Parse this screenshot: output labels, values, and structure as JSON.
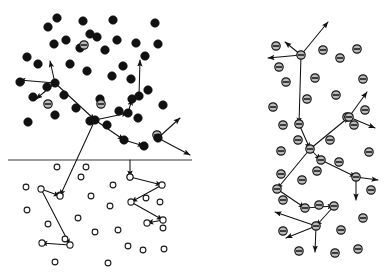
{
  "figure": {
    "background_color": "#ffffff",
    "ink_color": "#111111",
    "width": 391,
    "height": 280,
    "panel_count": 2
  },
  "legend_semantics": {
    "solid_circle": "filled particle (dense phase)",
    "open_circle": "open particle (dilute phase)",
    "hatched_circle": "hatched particle with horizontal bar (negatively marked species)"
  },
  "left_panel": {
    "name": "left-panel",
    "interface_line": {
      "x1": 8,
      "y1": 160,
      "x2": 192,
      "y2": 160,
      "color": "#3a3a3a"
    },
    "solid_particles": [
      [
        57,
        18
      ],
      [
        83,
        21
      ],
      [
        48,
        27
      ],
      [
        113,
        20
      ],
      [
        155,
        23
      ],
      [
        90,
        34
      ],
      [
        66,
        40
      ],
      [
        97,
        37
      ],
      [
        117,
        40
      ],
      [
        136,
        43
      ],
      [
        54,
        44
      ],
      [
        80,
        48
      ],
      [
        105,
        50
      ],
      [
        27,
        57
      ],
      [
        145,
        56
      ],
      [
        158,
        44
      ],
      [
        38,
        64
      ],
      [
        70,
        64
      ],
      [
        123,
        66
      ],
      [
        87,
        71
      ],
      [
        112,
        76
      ],
      [
        131,
        79
      ],
      [
        20,
        82
      ],
      [
        47,
        87
      ],
      [
        64,
        95
      ],
      [
        33,
        97
      ],
      [
        100,
        99
      ],
      [
        148,
        90
      ],
      [
        76,
        108
      ],
      [
        119,
        111
      ],
      [
        55,
        115
      ],
      [
        90,
        121
      ],
      [
        138,
        118
      ],
      [
        107,
        125
      ],
      [
        28,
        122
      ],
      [
        163,
        105
      ]
    ],
    "hatched_particles": [
      [
        84,
        45
      ],
      [
        48,
        104
      ],
      [
        101,
        104
      ],
      [
        157,
        135
      ]
    ],
    "open_particles": [
      [
        57,
        167
      ],
      [
        86,
        167
      ],
      [
        26,
        187
      ],
      [
        60,
        195
      ],
      [
        91,
        196
      ],
      [
        113,
        185
      ],
      [
        110,
        206
      ],
      [
        27,
        210
      ],
      [
        48,
        224
      ],
      [
        78,
        218
      ],
      [
        65,
        239
      ],
      [
        95,
        232
      ],
      [
        118,
        230
      ],
      [
        128,
        246
      ],
      [
        55,
        262
      ],
      [
        108,
        263
      ],
      [
        160,
        202
      ],
      [
        163,
        228
      ],
      [
        146,
        198
      ],
      [
        164,
        249
      ],
      [
        143,
        250
      ],
      [
        130,
        177
      ],
      [
        81,
        177
      ]
    ],
    "trajectory_solid": {
      "hub_a": [
        55,
        83
      ],
      "hub_b": [
        95,
        120
      ],
      "nodes": [
        [
          55,
          83
        ],
        [
          95,
          120
        ],
        [
          128,
          113
        ],
        [
          132,
          99
        ],
        [
          139,
          96
        ],
        [
          124,
          140
        ],
        [
          144,
          146
        ],
        [
          158,
          138
        ]
      ],
      "arrow_segments": [
        {
          "from": [
            55,
            83
          ],
          "to": [
            19,
            80
          ],
          "arrow": true
        },
        {
          "from": [
            55,
            83
          ],
          "to": [
            50,
            61
          ],
          "arrow": true
        },
        {
          "from": [
            55,
            83
          ],
          "to": [
            36,
            99
          ],
          "arrow": true
        },
        {
          "from": [
            55,
            83
          ],
          "to": [
            95,
            120
          ],
          "arrow": true
        },
        {
          "from": [
            95,
            120
          ],
          "to": [
            128,
            113
          ],
          "arrow": true
        },
        {
          "from": [
            128,
            113
          ],
          "to": [
            132,
            99
          ],
          "arrow": true
        },
        {
          "from": [
            132,
            99
          ],
          "to": [
            139,
            96
          ],
          "arrow": true
        },
        {
          "from": [
            139,
            96
          ],
          "to": [
            140,
            60
          ],
          "arrow": true
        },
        {
          "from": [
            95,
            120
          ],
          "to": [
            124,
            140
          ],
          "arrow": true
        },
        {
          "from": [
            124,
            140
          ],
          "to": [
            144,
            146
          ],
          "arrow": true
        },
        {
          "from": [
            158,
            138
          ],
          "to": [
            180,
            118
          ],
          "arrow": true
        },
        {
          "from": [
            158,
            138
          ],
          "to": [
            190,
            155
          ],
          "arrow": true
        },
        {
          "from": [
            95,
            120
          ],
          "to": [
            60,
            196
          ],
          "arrow": true
        }
      ]
    },
    "trajectory_open": {
      "nodes": [
        [
          41,
          189
        ],
        [
          60,
          196
        ],
        [
          70,
          245
        ],
        [
          42,
          243
        ],
        [
          130,
          177
        ],
        [
          162,
          185
        ],
        [
          131,
          202
        ],
        [
          163,
          220
        ],
        [
          147,
          223
        ]
      ],
      "arrow_segments": [
        {
          "from": [
            41,
            189
          ],
          "to": [
            60,
            196
          ],
          "arrow": true
        },
        {
          "from": [
            41,
            189
          ],
          "to": [
            70,
            245
          ],
          "arrow": true
        },
        {
          "from": [
            70,
            245
          ],
          "to": [
            41,
            243
          ],
          "arrow": true
        },
        {
          "from": [
            130,
            160
          ],
          "to": [
            130,
            177
          ],
          "arrow": true
        },
        {
          "from": [
            130,
            177
          ],
          "to": [
            162,
            185
          ],
          "arrow": true
        },
        {
          "from": [
            162,
            185
          ],
          "to": [
            131,
            202
          ],
          "arrow": true
        },
        {
          "from": [
            131,
            202
          ],
          "to": [
            163,
            220
          ],
          "arrow": true
        },
        {
          "from": [
            163,
            220
          ],
          "to": [
            147,
            223
          ],
          "arrow": true
        }
      ]
    }
  },
  "right_panel": {
    "name": "right-panel",
    "hatched_particles": [
      [
        276,
        46
      ],
      [
        323,
        50
      ],
      [
        357,
        49
      ],
      [
        279,
        67
      ],
      [
        286,
        82
      ],
      [
        315,
        78
      ],
      [
        340,
        58
      ],
      [
        363,
        79
      ],
      [
        273,
        107
      ],
      [
        307,
        99
      ],
      [
        336,
        95
      ],
      [
        283,
        125
      ],
      [
        365,
        110
      ],
      [
        298,
        140
      ],
      [
        330,
        140
      ],
      [
        281,
        151
      ],
      [
        354,
        125
      ],
      [
        369,
        152
      ],
      [
        302,
        180
      ],
      [
        371,
        190
      ],
      [
        339,
        162
      ],
      [
        281,
        174
      ],
      [
        283,
        200
      ],
      [
        319,
        205
      ],
      [
        363,
        218
      ],
      [
        341,
        230
      ],
      [
        283,
        231
      ],
      [
        299,
        251
      ],
      [
        335,
        253
      ],
      [
        358,
        249
      ],
      [
        317,
        171
      ],
      [
        347,
        117
      ]
    ],
    "trajectory": {
      "hub_top": [
        301,
        55
      ],
      "hub_mid": [
        310,
        149
      ],
      "hub_low": [
        316,
        226
      ],
      "nodes": [
        [
          301,
          55
        ],
        [
          299,
          124
        ],
        [
          310,
          149
        ],
        [
          349,
          117
        ],
        [
          321,
          160
        ],
        [
          277,
          189
        ],
        [
          305,
          208
        ],
        [
          334,
          206
        ],
        [
          316,
          226
        ],
        [
          356,
          177
        ]
      ],
      "arrow_segments": [
        {
          "from": [
            301,
            55
          ],
          "to": [
            268,
            58
          ],
          "arrow": true
        },
        {
          "from": [
            301,
            55
          ],
          "to": [
            285,
            42
          ],
          "arrow": true
        },
        {
          "from": [
            301,
            55
          ],
          "to": [
            328,
            22
          ],
          "arrow": true
        },
        {
          "from": [
            301,
            55
          ],
          "to": [
            299,
            124
          ],
          "arrow": true
        },
        {
          "from": [
            299,
            124
          ],
          "to": [
            310,
            149
          ],
          "arrow": true
        },
        {
          "from": [
            310,
            149
          ],
          "to": [
            349,
            117
          ],
          "arrow": true
        },
        {
          "from": [
            349,
            117
          ],
          "to": [
            367,
            92
          ],
          "arrow": true
        },
        {
          "from": [
            349,
            117
          ],
          "to": [
            375,
            128
          ],
          "arrow": true
        },
        {
          "from": [
            310,
            149
          ],
          "to": [
            321,
            160
          ],
          "arrow": true
        },
        {
          "from": [
            321,
            160
          ],
          "to": [
            356,
            177
          ],
          "arrow": true
        },
        {
          "from": [
            356,
            177
          ],
          "to": [
            378,
            180
          ],
          "arrow": true
        },
        {
          "from": [
            356,
            177
          ],
          "to": [
            356,
            200
          ],
          "arrow": true
        },
        {
          "from": [
            310,
            149
          ],
          "to": [
            277,
            189
          ],
          "arrow": true
        },
        {
          "from": [
            277,
            189
          ],
          "to": [
            305,
            208
          ],
          "arrow": true
        },
        {
          "from": [
            305,
            208
          ],
          "to": [
            334,
            206
          ],
          "arrow": true
        },
        {
          "from": [
            334,
            206
          ],
          "to": [
            316,
            226
          ],
          "arrow": true
        },
        {
          "from": [
            316,
            226
          ],
          "to": [
            275,
            212
          ],
          "arrow": true
        },
        {
          "from": [
            316,
            226
          ],
          "to": [
            286,
            238
          ],
          "arrow": true
        },
        {
          "from": [
            316,
            226
          ],
          "to": [
            315,
            252
          ],
          "arrow": true
        }
      ]
    }
  }
}
